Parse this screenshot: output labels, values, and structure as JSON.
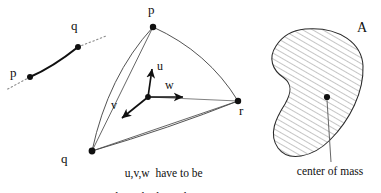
{
  "figure": {
    "title_alt": "Curve segment, triangle with vectors, and hatched region with center of mass",
    "background_color": "#ffffff",
    "ink_color": "#101010",
    "line_color": "#3a3a3a",
    "width": 381,
    "height": 193
  },
  "panel_curve": {
    "name": "curve-segment-panel",
    "point_p_label": "p",
    "point_q_label": "q",
    "points": [
      {
        "id": "p",
        "x": 30,
        "y": 77
      },
      {
        "id": "q",
        "x": 78,
        "y": 47
      }
    ],
    "solid_path": "M 30 77 Q 52 66 78 47",
    "dotted_left_path": "M 30 77 L 6 90",
    "dotted_right_path": "M 78 47 L 105 36",
    "dot_radius": 3
  },
  "panel_triangle": {
    "name": "triangle-vectors-panel",
    "vertex_p_label": "p",
    "vertex_q_label": "q",
    "vertex_r_label": "r",
    "vector_u_label": "u",
    "vector_v_label": "v",
    "vector_w_label": "w",
    "caption_line1": "u,v,w  have to be",
    "caption_line2": "linearly dependant",
    "vertices": [
      {
        "id": "p",
        "x": 153,
        "y": 27
      },
      {
        "id": "r",
        "x": 238,
        "y": 101
      },
      {
        "id": "q",
        "x": 92,
        "y": 151
      }
    ],
    "origin": {
      "x": 148,
      "y": 97
    },
    "vectors": [
      {
        "id": "u",
        "tip_x": 152,
        "tip_y": 67
      },
      {
        "id": "w",
        "tip_x": 185,
        "tip_y": 97
      },
      {
        "id": "v",
        "tip_x": 121,
        "tip_y": 119
      }
    ],
    "edges": [
      {
        "from": "p",
        "to": "r",
        "curved": true
      },
      {
        "from": "p",
        "to": "q",
        "curved": true
      },
      {
        "from": "q",
        "to": "r",
        "curved": true
      }
    ],
    "dot_radius": 3.2
  },
  "panel_region": {
    "name": "hatched-region-panel",
    "area_label": "A",
    "center_of_mass_label": "center of mass",
    "center_of_mass_point": {
      "x": 327,
      "y": 97
    },
    "leader_line": {
      "x1": 327,
      "y1": 100,
      "x2": 330,
      "y2": 162
    },
    "hatch_angle_deg": 60,
    "hatch_spacing": 5,
    "outline_path": "M 305 29 C 340 26 362 44 363 66 C 364 92 350 120 330 140 C 312 158 288 162 278 148 C 268 134 276 118 285 104 C 292 92 292 84 284 78 C 272 70 268 58 276 46 C 283 35 294 30 305 29 Z"
  }
}
